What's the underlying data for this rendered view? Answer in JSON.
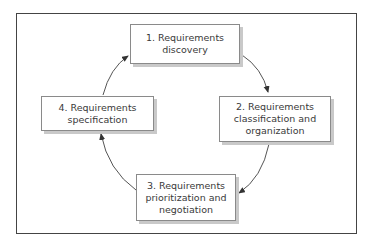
{
  "diagram": {
    "type": "cycle",
    "nodes": [
      {
        "id": "1",
        "label": "1. Requirements\ndiscovery"
      },
      {
        "id": "2",
        "label": "2. Requirements\nclassification and\norganization"
      },
      {
        "id": "3",
        "label": "3. Requirements\nprioritization and\nnegotiation"
      },
      {
        "id": "4",
        "label": "4. Requirements\nspecification"
      }
    ],
    "edges": [
      {
        "from": "1",
        "to": "2"
      },
      {
        "from": "2",
        "to": "3"
      },
      {
        "from": "3",
        "to": "4"
      },
      {
        "from": "4",
        "to": "1"
      }
    ],
    "colors": {
      "frame": "#444444",
      "box_border": "#8a8a8a",
      "box_shadow": "#c9c9c9",
      "text": "#3a3a3a",
      "arrow": "#555555"
    }
  }
}
